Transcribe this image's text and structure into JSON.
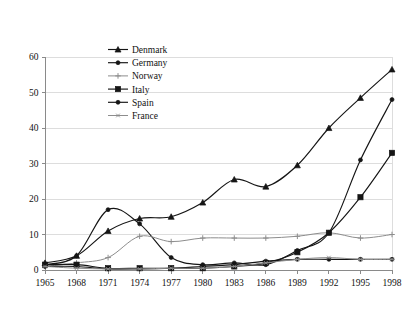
{
  "chart_data": {
    "type": "line",
    "title": "",
    "subtitle": "",
    "xlabel": "",
    "ylabel": "",
    "x": [
      1965,
      1968,
      1971,
      1974,
      1977,
      1980,
      1983,
      1986,
      1989,
      1992,
      1995,
      1998
    ],
    "xticklabels": [
      "1965",
      "1968",
      "1971",
      "1974",
      "1977",
      "1980",
      "1983",
      "1986",
      "1989",
      "1992",
      "1995",
      "1998"
    ],
    "yticklabels": [
      "0",
      "10",
      "20",
      "30",
      "40",
      "50",
      "60"
    ],
    "yticks": [
      0,
      10,
      20,
      30,
      40,
      50,
      60
    ],
    "xlim": [
      1965,
      1998
    ],
    "ylim": [
      0,
      60
    ],
    "grid": "horizontal",
    "legend_position": "inside-upper-left-center",
    "series": [
      {
        "name": "Denmark",
        "marker": "triangle",
        "color": "#151515",
        "values": [
          2.0,
          4.0,
          11.0,
          14.5,
          15.0,
          19.0,
          25.5,
          23.5,
          29.5,
          40.0,
          48.5,
          56.5
        ]
      },
      {
        "name": "Germany",
        "marker": "circle",
        "color": "#151515",
        "values": [
          1.5,
          4.0,
          17.0,
          13.0,
          3.5,
          1.5,
          2.0,
          1.5,
          5.5,
          10.5,
          31.0,
          48.0
        ]
      },
      {
        "name": "Norway",
        "marker": "plus",
        "color": "#8d8d8d",
        "values": [
          1.0,
          2.0,
          3.5,
          9.5,
          8.0,
          9.0,
          9.0,
          9.0,
          9.5,
          10.5,
          9.0,
          10.0
        ]
      },
      {
        "name": "Italy",
        "marker": "square",
        "color": "#151515",
        "values": [
          1.5,
          1.5,
          0.5,
          0.5,
          0.5,
          0.5,
          1.0,
          2.0,
          5.0,
          10.5,
          20.5,
          33.0
        ]
      },
      {
        "name": "Spain",
        "marker": "circle",
        "color": "#151515",
        "values": [
          1.0,
          1.0,
          0.3,
          0.3,
          0.5,
          1.0,
          1.5,
          2.5,
          3.0,
          3.0,
          3.0,
          3.0
        ]
      },
      {
        "name": "France",
        "marker": "star",
        "color": "#8d8d8d",
        "values": [
          1.0,
          0.5,
          0.3,
          0.3,
          0.5,
          0.5,
          1.0,
          2.0,
          3.0,
          3.5,
          3.0,
          3.0
        ]
      }
    ]
  },
  "legend": {
    "entries": [
      {
        "label": "Denmark"
      },
      {
        "label": "Germany"
      },
      {
        "label": "Norway"
      },
      {
        "label": "Italy"
      },
      {
        "label": "Spain"
      },
      {
        "label": "France"
      }
    ]
  }
}
